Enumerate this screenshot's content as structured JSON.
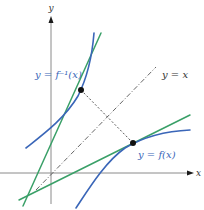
{
  "diagram": {
    "axes": {
      "x_label": "x",
      "y_label": "y"
    },
    "labels": {
      "identity_line": "y = x",
      "inverse_function": "y = f⁻¹(x)",
      "function": "y = f(x)"
    },
    "colors": {
      "curve": "#3a66b8",
      "tangent": "#3aa068",
      "axis": "#8a8a8a",
      "identity": "#555555",
      "point": "#111111"
    },
    "elements": [
      {
        "name": "curve-f",
        "kind": "curve",
        "label": "y = f(x)"
      },
      {
        "name": "curve-f-inverse",
        "kind": "curve",
        "label": "y = f⁻¹(x)"
      },
      {
        "name": "tangent-f",
        "kind": "tangent line",
        "at": "point on f"
      },
      {
        "name": "tangent-f-inverse",
        "kind": "tangent line",
        "at": "point on f⁻¹"
      },
      {
        "name": "identity-line",
        "kind": "dash-dot line",
        "label": "y = x"
      },
      {
        "name": "reflection-segment",
        "kind": "dashed segment",
        "connects": [
          "point on f⁻¹",
          "point on f"
        ]
      }
    ]
  }
}
